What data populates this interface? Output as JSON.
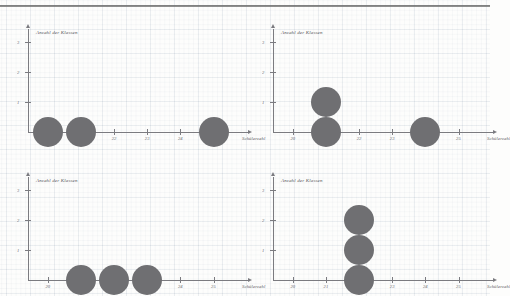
{
  "page": {
    "background_color": "#fdfdfc",
    "dot_color": "#6f6f72",
    "axis_color": "#7b7b80",
    "grid": "graph-paper",
    "panel_count": 4
  },
  "axes": {
    "x_title": "Schülerzahl",
    "y_title": "Anzahl der Klassen",
    "x_ticks": [
      "20",
      "21",
      "22",
      "23",
      "24",
      "25"
    ],
    "y_ticks": [
      "1",
      "2",
      "3"
    ]
  },
  "chart_data": [
    {
      "type": "scatter",
      "title": "",
      "xlabel": "Schülerzahl",
      "ylabel": "Anzahl der Klassen",
      "categories": [
        "20",
        "21",
        "22",
        "23",
        "24",
        "25"
      ],
      "values": [
        1,
        1,
        0,
        0,
        0,
        1
      ],
      "xlim": [
        19.4,
        25.8
      ],
      "ylim": [
        0,
        3.4
      ],
      "grid": true,
      "legend": "none",
      "panel": 1
    },
    {
      "type": "scatter",
      "title": "",
      "xlabel": "Schülerzahl",
      "ylabel": "Anzahl der Klassen",
      "categories": [
        "20",
        "21",
        "22",
        "23",
        "24",
        "25"
      ],
      "values": [
        0,
        2,
        0,
        0,
        1,
        0
      ],
      "xlim": [
        19.4,
        25.8
      ],
      "ylim": [
        0,
        3.4
      ],
      "grid": true,
      "legend": "none",
      "panel": 2
    },
    {
      "type": "scatter",
      "title": "",
      "xlabel": "Schülerzahl",
      "ylabel": "Anzahl der Klassen",
      "categories": [
        "20",
        "21",
        "22",
        "23",
        "24",
        "25"
      ],
      "values": [
        0,
        1,
        1,
        1,
        0,
        0
      ],
      "xlim": [
        19.4,
        25.8
      ],
      "ylim": [
        0,
        3.4
      ],
      "grid": true,
      "legend": "none",
      "panel": 3
    },
    {
      "type": "scatter",
      "title": "",
      "xlabel": "Schülerzahl",
      "ylabel": "Anzahl der Klassen",
      "categories": [
        "20",
        "21",
        "22",
        "23",
        "24",
        "25"
      ],
      "values": [
        0,
        0,
        3,
        0,
        0,
        0
      ],
      "xlim": [
        19.4,
        25.8
      ],
      "ylim": [
        0,
        3.4
      ],
      "grid": true,
      "legend": "none",
      "panel": 4
    }
  ]
}
